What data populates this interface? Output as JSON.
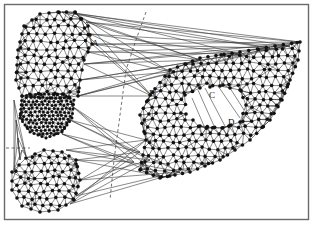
{
  "figure": {
    "width": 314,
    "height": 227,
    "frame": {
      "x": 4.5,
      "y": 4.5,
      "w": 304,
      "h": 215,
      "color": "#6a6a6a"
    },
    "colors": {
      "node": "#111111",
      "edge": "#2a2a2a",
      "background": "#ffffff"
    }
  },
  "labels": [
    {
      "id": "A",
      "text": "A",
      "x": 92,
      "y": 46
    },
    {
      "id": "B",
      "text": "B",
      "x": 149,
      "y": 96
    },
    {
      "id": "C",
      "text": "C",
      "x": 209,
      "y": 98
    },
    {
      "id": "D",
      "text": "D",
      "x": 228,
      "y": 125
    }
  ],
  "regions": [
    {
      "name": "upper-left-lobe",
      "type": "mesh",
      "outline": [
        [
          58,
          12
        ],
        [
          75,
          12
        ],
        [
          88,
          26
        ],
        [
          92,
          44
        ],
        [
          84,
          60
        ],
        [
          80,
          80
        ],
        [
          78,
          96
        ],
        [
          60,
          98
        ],
        [
          40,
          98
        ],
        [
          22,
          96
        ],
        [
          16,
          80
        ],
        [
          18,
          50
        ],
        [
          24,
          26
        ],
        [
          40,
          14
        ]
      ],
      "spacing": 8.5
    },
    {
      "name": "dense-waist",
      "type": "mesh",
      "outline": [
        [
          22,
          96
        ],
        [
          40,
          94
        ],
        [
          62,
          94
        ],
        [
          74,
          100
        ],
        [
          72,
          118
        ],
        [
          62,
          132
        ],
        [
          46,
          138
        ],
        [
          30,
          132
        ],
        [
          20,
          118
        ]
      ],
      "spacing": 4.2
    },
    {
      "name": "lower-left-lobe",
      "type": "mesh",
      "outline": [
        [
          26,
          158
        ],
        [
          44,
          150
        ],
        [
          62,
          152
        ],
        [
          76,
          160
        ],
        [
          80,
          180
        ],
        [
          74,
          200
        ],
        [
          58,
          210
        ],
        [
          40,
          212
        ],
        [
          22,
          206
        ],
        [
          12,
          190
        ],
        [
          12,
          172
        ]
      ],
      "spacing": 8
    },
    {
      "name": "right-ring",
      "type": "ring",
      "outer": [
        [
          150,
          95
        ],
        [
          170,
          70
        ],
        [
          200,
          58
        ],
        [
          240,
          52
        ],
        [
          275,
          46
        ],
        [
          300,
          42
        ],
        [
          298,
          60
        ],
        [
          290,
          80
        ],
        [
          282,
          100
        ],
        [
          270,
          120
        ],
        [
          250,
          140
        ],
        [
          220,
          160
        ],
        [
          190,
          172
        ],
        [
          160,
          178
        ],
        [
          140,
          170
        ],
        [
          146,
          140
        ],
        [
          140,
          115
        ]
      ],
      "inner": [
        [
          185,
          95
        ],
        [
          200,
          88
        ],
        [
          220,
          86
        ],
        [
          240,
          90
        ],
        [
          246,
          105
        ],
        [
          240,
          122
        ],
        [
          222,
          128
        ],
        [
          200,
          126
        ],
        [
          186,
          114
        ]
      ],
      "spacing": 8.2
    }
  ],
  "bridges": {
    "description": "long connecting edges between lobes and ring",
    "from_region": "upper-left-lobe",
    "to_region": "right-ring"
  },
  "dashed_curve": {
    "points": [
      [
        146,
        12
      ],
      [
        136,
        40
      ],
      [
        126,
        70
      ],
      [
        122,
        100
      ],
      [
        118,
        130
      ],
      [
        114,
        160
      ],
      [
        110,
        200
      ]
    ]
  },
  "dashed_horizontal": {
    "points": [
      [
        6,
        148
      ],
      [
        30,
        148
      ]
    ]
  }
}
